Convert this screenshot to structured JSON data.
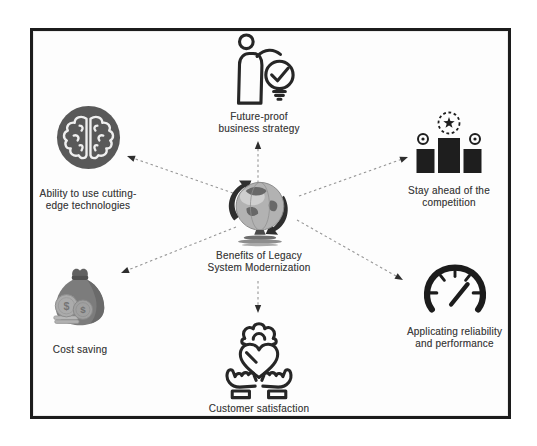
{
  "center": {
    "label": "Benefits of Legacy\nSystem Modernization",
    "icon": "globe-icon"
  },
  "nodes": {
    "future_proof": {
      "label": "Future-proof\nbusiness strategy",
      "icon": "person-idea-check-icon"
    },
    "cutting_edge": {
      "label": "Ability to use cutting-\nedge technologies",
      "icon": "brain-icon"
    },
    "stay_ahead": {
      "label": "Stay ahead of the\ncompetition",
      "icon": "podium-winner-icon"
    },
    "cost_saving": {
      "label": "Cost saving",
      "icon": "money-bag-icon"
    },
    "customer_satisfaction": {
      "label": "Customer satisfaction",
      "icon": "hands-heart-icon"
    },
    "reliability": {
      "label": "Applicating reliability\nand performance",
      "icon": "speedometer-icon"
    }
  },
  "colors": {
    "frame_border": "#1c1c1c",
    "background": "#ffffff",
    "icon_ink": "#262626",
    "arrow_line": "#969696",
    "arrow_head": "#2e2e2e",
    "label_text": "#3e3e3e",
    "brain_circle_fill": "#595959",
    "money_bag_fill": "#7c7c7c",
    "globe_fill": "#b2b2b2"
  }
}
